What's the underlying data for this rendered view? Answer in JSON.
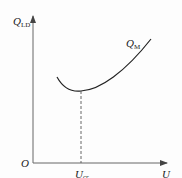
{
  "diagram": {
    "type": "curve-plot",
    "y_axis": {
      "label": "Q",
      "label_sub": "LD"
    },
    "x_axis": {
      "label": "U"
    },
    "origin": {
      "label": "O"
    },
    "curve": {
      "label": "Q",
      "label_sub": "M",
      "shape": "convex curve with minimum"
    },
    "marker": {
      "label": "U",
      "label_sub": "cr",
      "style": "dashed vertical line from curve minimum to x-axis"
    },
    "colors": {
      "axis": "#555555",
      "curve": "#222222",
      "text": "#222222"
    }
  }
}
